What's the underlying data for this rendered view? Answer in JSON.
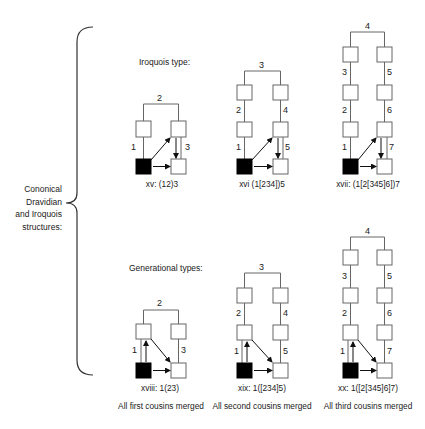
{
  "side_label": [
    "Cononical",
    "Dravidian",
    "and  Iroquois",
    "structures:"
  ],
  "sections": {
    "iroquois": {
      "title": "Iroquois type:"
    },
    "generational": {
      "title": "Generational types:"
    }
  },
  "diagrams": [
    {
      "id": "xv",
      "caption": "xv: (12)3",
      "numbers": {
        "bar": "2",
        "left": [
          "1"
        ],
        "right": [
          "3"
        ]
      }
    },
    {
      "id": "xvi",
      "caption": "xvi (1[234])5",
      "numbers": {
        "bar": "3",
        "left": [
          "2",
          "1"
        ],
        "right": [
          "4",
          "5"
        ]
      }
    },
    {
      "id": "xvii",
      "caption": "xvii: (1[2[345]6])7",
      "numbers": {
        "bar": "4",
        "left": [
          "3",
          "2",
          "1"
        ],
        "right": [
          "5",
          "6",
          "7"
        ]
      }
    },
    {
      "id": "xviii",
      "caption": "xviii: 1(23)",
      "subcaption": "All first cousins merged",
      "numbers": {
        "bar": "2",
        "left": [
          "1"
        ],
        "right": [
          "3"
        ]
      }
    },
    {
      "id": "xix",
      "caption": "xix: 1([234]5)",
      "subcaption": "All second cousins merged",
      "numbers": {
        "bar": "3",
        "left": [
          "2",
          "1"
        ],
        "right": [
          "4",
          "5"
        ]
      }
    },
    {
      "id": "xx",
      "caption": "xx: 1([2[345]6]7)",
      "subcaption": "All third cousins merged",
      "numbers": {
        "bar": "4",
        "left": [
          "3",
          "2",
          "1"
        ],
        "right": [
          "5",
          "6",
          "7"
        ]
      }
    }
  ],
  "colors": {
    "line": "#555555",
    "ego": "#000000",
    "box_fill": "#ffffff"
  }
}
